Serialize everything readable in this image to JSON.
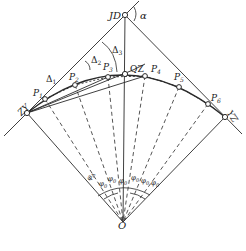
{
  "diagram": {
    "type": "circular-curve-deflection-angle-layout",
    "colors": {
      "line": "#2a2a2a",
      "background": "#ffffff"
    },
    "points": {
      "JD": {
        "label": "JD",
        "x": 125,
        "y": 15
      },
      "O": {
        "label": "O",
        "x": 123,
        "y": 222
      },
      "ZY": {
        "label": "ZY",
        "x": 27,
        "y": 113
      },
      "YZ": {
        "label": "YZ",
        "x": 225,
        "y": 117
      },
      "QZ": {
        "label": "QZ",
        "x": 125,
        "y": 74
      },
      "P1": {
        "label": "P",
        "sub": "1",
        "x": 45,
        "y": 99
      },
      "P2": {
        "label": "P",
        "sub": "2",
        "x": 75,
        "y": 85
      },
      "P3": {
        "label": "P",
        "sub": "3",
        "x": 108,
        "y": 77
      },
      "P4": {
        "label": "P",
        "sub": "4",
        "x": 145,
        "y": 76
      },
      "P5": {
        "label": "P",
        "sub": "5",
        "x": 179,
        "y": 87
      },
      "P6": {
        "label": "P",
        "sub": "6",
        "x": 208,
        "y": 104
      }
    },
    "angles": {
      "alpha": "α",
      "delta1": {
        "sym": "Δ",
        "sub": "1"
      },
      "delta2": {
        "sym": "Δ",
        "sub": "2"
      },
      "delta3": {
        "sym": "Δ",
        "sub": "3"
      },
      "phiA": {
        "sym": "φ",
        "sub": "A"
      },
      "phi0": {
        "sym": "φ",
        "sub": "0"
      }
    }
  }
}
